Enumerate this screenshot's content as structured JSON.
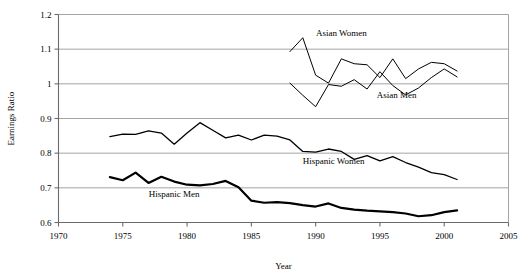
{
  "chart_data": {
    "type": "line",
    "title": "",
    "xlabel": "Year",
    "ylabel": "Earnings Ratio",
    "xlim": [
      1970,
      2005
    ],
    "ylim": [
      0.6,
      1.2
    ],
    "xticks": [
      "1970",
      "1975",
      "1980",
      "1985",
      "1990",
      "1995",
      "2000",
      "2005"
    ],
    "yticks": [
      "0.6",
      "0.7",
      "0.8",
      "0.9",
      "1",
      "1.1",
      "1.2"
    ],
    "grid": "horizontal",
    "legend_position": "inline-annotations",
    "series": [
      {
        "name": "Asian Women",
        "label_x": 1992.0,
        "label_y": 1.139,
        "color": "#000000",
        "width": 1.0,
        "x": [
          1988,
          1989,
          1990,
          1991,
          1992,
          1993,
          1994,
          1995,
          1996,
          1997,
          1998,
          1999,
          2000,
          2001
        ],
        "values": [
          1.093,
          1.133,
          1.025,
          1.002,
          1.072,
          1.058,
          1.055,
          1.018,
          1.072,
          1.015,
          1.043,
          1.062,
          1.058,
          1.037
        ]
      },
      {
        "name": "Asian Men",
        "label_x": 1996.3,
        "label_y": 0.958,
        "color": "#000000",
        "width": 1.0,
        "x": [
          1988,
          1989,
          1990,
          1991,
          1992,
          1993,
          1994,
          1995,
          1996,
          1997,
          1998,
          1999,
          2000,
          2001
        ],
        "values": [
          1.002,
          0.967,
          0.934,
          0.998,
          0.993,
          1.012,
          0.985,
          1.035,
          0.995,
          0.968,
          0.988,
          1.018,
          1.043,
          1.02
        ]
      },
      {
        "name": "Hispanic Women",
        "label_x": 1991.4,
        "label_y": 0.769,
        "color": "#000000",
        "width": 1.3,
        "x": [
          1974,
          1975,
          1976,
          1977,
          1978,
          1979,
          1980,
          1981,
          1982,
          1983,
          1984,
          1985,
          1986,
          1987,
          1988,
          1989,
          1990,
          1991,
          1992,
          1993,
          1994,
          1995,
          1996,
          1997,
          1998,
          1999,
          2000,
          2001
        ],
        "values": [
          0.848,
          0.855,
          0.854,
          0.864,
          0.858,
          0.826,
          0.858,
          0.888,
          0.866,
          0.844,
          0.852,
          0.838,
          0.852,
          0.849,
          0.838,
          0.805,
          0.803,
          0.812,
          0.805,
          0.782,
          0.793,
          0.778,
          0.79,
          0.773,
          0.76,
          0.744,
          0.738,
          0.724
        ]
      },
      {
        "name": "Hispanic Men",
        "label_x": 1979.0,
        "label_y": 0.673,
        "color": "#000000",
        "width": 2.2,
        "x": [
          1974,
          1975,
          1976,
          1977,
          1978,
          1979,
          1980,
          1981,
          1982,
          1983,
          1984,
          1985,
          1986,
          1987,
          1988,
          1989,
          1990,
          1991,
          1992,
          1993,
          1994,
          1995,
          1996,
          1997,
          1998,
          1999,
          2000,
          2001
        ],
        "values": [
          0.731,
          0.722,
          0.744,
          0.714,
          0.732,
          0.718,
          0.709,
          0.707,
          0.711,
          0.72,
          0.702,
          0.663,
          0.657,
          0.659,
          0.656,
          0.65,
          0.646,
          0.655,
          0.642,
          0.637,
          0.634,
          0.632,
          0.63,
          0.626,
          0.618,
          0.621,
          0.63,
          0.635
        ]
      }
    ]
  }
}
